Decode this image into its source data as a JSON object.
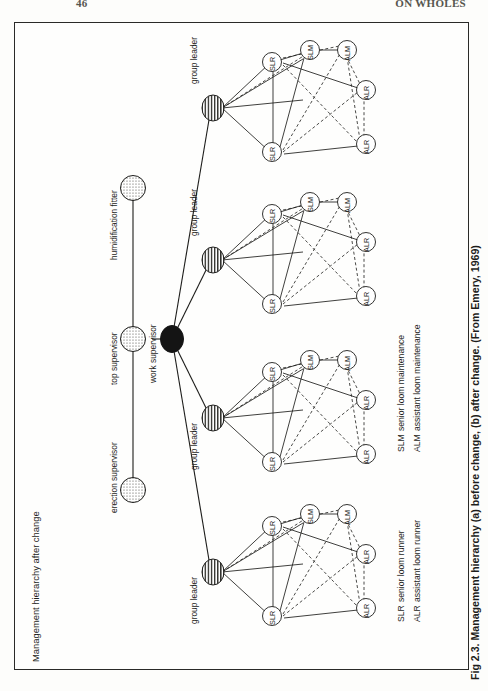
{
  "page": {
    "folio": "46",
    "running_head": "ON WHOLES"
  },
  "figure": {
    "panel_title": "Management hierarchy after change",
    "caption": "Fig 2.3. Management hierarchy (a) before change, (b) after change. (From Emery, 1969)"
  },
  "supervisors": [
    {
      "id": "erection",
      "label": "erection supervisor",
      "fill": "dotted"
    },
    {
      "id": "top",
      "label": "top supervisor",
      "fill": "dotted"
    },
    {
      "id": "humidification",
      "label": "humidification fitter",
      "fill": "dotted"
    }
  ],
  "work_supervisor": {
    "label": "work supervisor",
    "fill": "solid-black"
  },
  "group_leaders": [
    {
      "id": "gl1",
      "label": "group leader",
      "fill": "striped"
    },
    {
      "id": "gl2",
      "label": "group leader",
      "fill": "striped"
    },
    {
      "id": "gl3",
      "label": "group leader",
      "fill": "striped"
    },
    {
      "id": "gl4",
      "label": "group leader",
      "fill": "striped"
    }
  ],
  "cluster_roles": [
    "SLR",
    "SLR",
    "SLM",
    "ALM",
    "ALR",
    "ALR"
  ],
  "legend": {
    "column_one": [
      {
        "code": "SLR",
        "meaning": "senior loom runner"
      },
      {
        "code": "ALR",
        "meaning": "assistant loom runner"
      }
    ],
    "column_two": [
      {
        "code": "SLM",
        "meaning": "senior loom maintenance"
      },
      {
        "code": "ALM",
        "meaning": "assistant loom maintenance"
      }
    ]
  },
  "colors": {
    "ink": "#1d1d1b",
    "paper": "#fefefd",
    "frame": "#2a2a28"
  }
}
